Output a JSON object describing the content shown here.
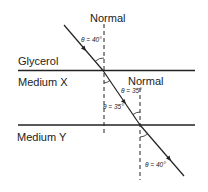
{
  "diagram": {
    "media": [
      {
        "name": "Glycerol"
      },
      {
        "name": "Medium X"
      },
      {
        "name": "Medium Y"
      }
    ],
    "normals": [
      {
        "label": "Normal"
      },
      {
        "label": "Normal"
      }
    ],
    "angles": [
      {
        "label": "θ = 40°",
        "location": "incident in Glycerol"
      },
      {
        "label": "θ = 35°",
        "location": "refracted in Medium X"
      },
      {
        "label": "θ = 35°",
        "location": "incident at Medium X / Medium Y boundary"
      },
      {
        "label": "θ = 40°",
        "location": "refracted in Medium Y"
      }
    ],
    "colors": {
      "line": "#222222",
      "background": "#ffffff"
    }
  }
}
